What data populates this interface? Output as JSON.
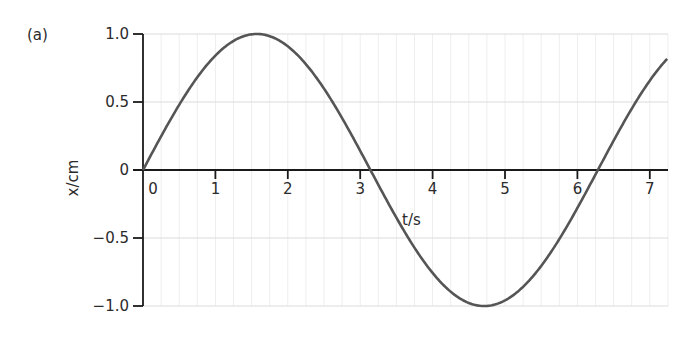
{
  "panel_label": "(a)",
  "chart_data": {
    "type": "line",
    "title": "",
    "xlabel": "t/s",
    "ylabel": "x/cm",
    "xlim": [
      0,
      7.25
    ],
    "ylim": [
      -1.0,
      1.0
    ],
    "x_ticks": [
      0,
      1,
      2,
      3,
      4,
      5,
      6,
      7
    ],
    "x_tick_labels": [
      "0",
      "1",
      "2",
      "3",
      "4",
      "5",
      "6",
      "7"
    ],
    "y_ticks": [
      1.0,
      0.5,
      0,
      -0.5,
      -1.0
    ],
    "y_tick_labels": [
      "1.0",
      "0.5",
      "0",
      "−0.5",
      "−1.0"
    ],
    "grid": {
      "horizontal_lines": true,
      "vertical_minor_lines": true,
      "color": "#dcdcdc"
    },
    "legend": null,
    "series": [
      {
        "name": "x = sin(t)",
        "function": "sin",
        "amplitude": 1.0,
        "period": 6.283,
        "phase": 0,
        "color": "#555555",
        "x": [
          0,
          0.785,
          1.571,
          2.356,
          3.142,
          3.927,
          4.712,
          5.498,
          6.283,
          7.069,
          7.25
        ],
        "values": [
          0,
          0.71,
          1.0,
          0.71,
          0,
          -0.71,
          -1.0,
          -0.71,
          0,
          0.71,
          0.82
        ]
      }
    ]
  },
  "layout": {
    "origin_px": [
      143,
      170
    ],
    "px_per_x_unit": 72.4,
    "px_per_y_unit": 136,
    "x_axis_end_px": 668
  },
  "colors": {
    "axis": "#1a1a1a",
    "curve": "#555555",
    "grid": "#dcdcdc",
    "text": "#2b2b2b"
  }
}
